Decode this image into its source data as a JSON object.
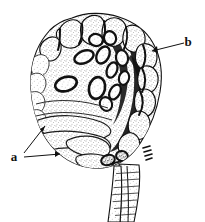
{
  "figure": {
    "kind": "scientific-line-illustration",
    "background_color": "#ffffff",
    "ink_color": "#111111",
    "stipple_color": "#3a3a3a",
    "width": 205,
    "height": 222
  },
  "labels": [
    {
      "id": "a",
      "text": "a",
      "x": 14,
      "y": 161,
      "leaders": [
        {
          "from_x": 24,
          "from_y": 153,
          "to_x": 45,
          "to_y": 126
        },
        {
          "from_x": 24,
          "from_y": 157,
          "to_x": 60,
          "to_y": 154
        }
      ]
    },
    {
      "id": "b",
      "text": "b",
      "x": 186,
      "y": 46,
      "leaders": [
        {
          "from_x": 184,
          "from_y": 43,
          "to_x": 152,
          "to_y": 51
        }
      ]
    }
  ],
  "parts": {
    "body_outline": "irregular ovoid mass of crenulate lobes",
    "upper_crown": "ring of rounded marginal lobes with dark clefts",
    "inner_ovals": "scattered dark-rimmed oval bodies",
    "dark_zone": "dense black shaded region on right of center",
    "lower_lobes": "elongated finger-like basal lobes (label a)",
    "margin_lobes": "scalloped right marginal lobes (label b)",
    "stalk": "two-branched hatched stalk descending from base"
  }
}
